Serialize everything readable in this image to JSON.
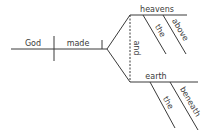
{
  "diagram": {
    "type": "sentence-diagram",
    "sentence_parts": {
      "subject": "God",
      "verb": "made",
      "conjunction": "and",
      "object_1": {
        "word": "heavens",
        "modifiers": [
          "the",
          "above"
        ]
      },
      "object_2": {
        "word": "earth",
        "modifiers": [
          "the",
          "beneath"
        ]
      }
    },
    "colors": {
      "line": "#3a3a3a",
      "text": "#3a3a3a",
      "background": "#ffffff"
    }
  }
}
